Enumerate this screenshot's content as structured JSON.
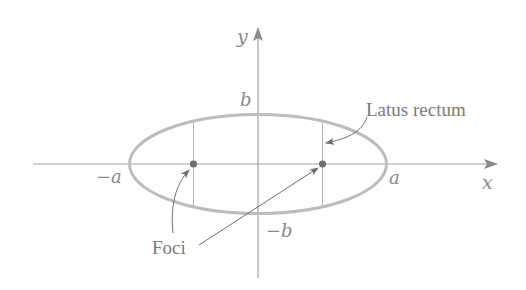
{
  "figure": {
    "type": "ellipse-diagram",
    "colors": {
      "axis": "#9a9a9a",
      "ellipse": "#b8b8b8",
      "latus": "#b0b0b0",
      "focus": "#6e6e6e",
      "pointer": "#707070",
      "text": "#808080"
    },
    "axes": {
      "x_label": "x",
      "y_label": "y"
    },
    "vertex_labels": {
      "neg_a": "−a",
      "pos_a": "a",
      "pos_b": "b",
      "neg_b": "−b"
    },
    "annotations": {
      "latus_rectum": "Latus rectum",
      "foci": "Foci"
    }
  }
}
